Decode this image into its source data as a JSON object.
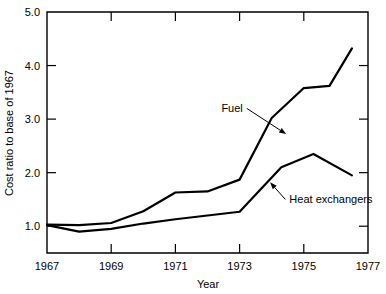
{
  "chart_data": {
    "type": "line",
    "title": "",
    "xlabel": "Year",
    "ylabel": "Cost ratio to base of 1967",
    "xlim": [
      1967,
      1977
    ],
    "ylim": [
      0.5,
      5.0
    ],
    "xticks": [
      1967,
      1969,
      1971,
      1973,
      1975,
      1977
    ],
    "xticklabels": [
      "1967",
      "1969",
      "1971",
      "1973",
      "1975",
      "1977"
    ],
    "yticks": [
      1.0,
      2.0,
      3.0,
      4.0,
      5.0
    ],
    "yticklabels": [
      "1.0",
      "2.0",
      "3.0",
      "4.0",
      "5.0"
    ],
    "grid": false,
    "legend_position": "inline-annotations",
    "series": [
      {
        "name": "Fuel",
        "label": "Fuel",
        "color": "#000000",
        "x": [
          1967.0,
          1968.0,
          1969.0,
          1970.0,
          1971.0,
          1972.0,
          1973.0,
          1974.0,
          1975.0,
          1975.8,
          1976.5
        ],
        "values": [
          1.03,
          1.02,
          1.06,
          1.28,
          1.63,
          1.65,
          1.87,
          3.02,
          3.58,
          3.62,
          4.32
        ]
      },
      {
        "name": "Heat exchangers",
        "label": "Heat exchangers",
        "color": "#000000",
        "x": [
          1967.0,
          1968.0,
          1969.0,
          1970.0,
          1971.0,
          1972.0,
          1973.0,
          1974.3,
          1975.3,
          1976.5
        ],
        "values": [
          1.02,
          0.9,
          0.95,
          1.05,
          1.13,
          1.2,
          1.27,
          2.1,
          2.35,
          1.95
        ]
      }
    ],
    "annotations": [
      {
        "text": "Fuel",
        "target_x": 1974.45,
        "target_y": 2.72,
        "label_x": 1973.1,
        "label_y": 3.2
      },
      {
        "text": "Heat exchangers",
        "target_x": 1973.95,
        "target_y": 1.82,
        "label_x": 1974.55,
        "label_y": 1.5
      }
    ]
  }
}
